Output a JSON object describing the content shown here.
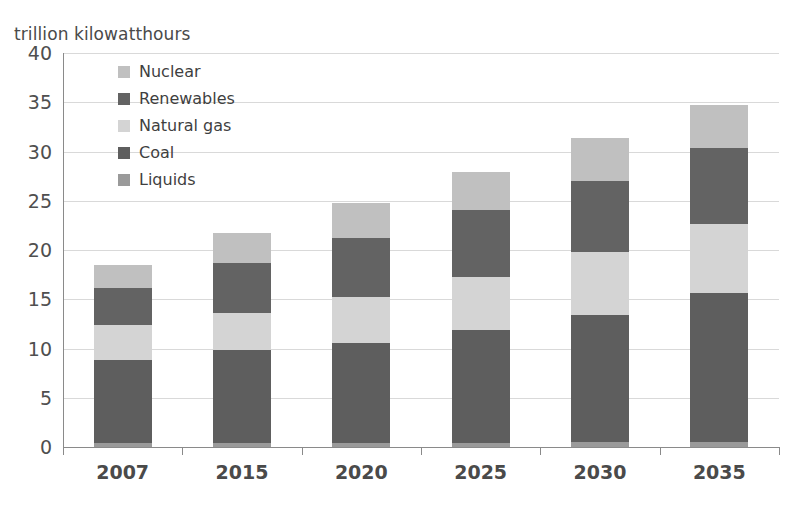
{
  "chart_data": {
    "type": "bar",
    "stacked": true,
    "title": "",
    "subtitle": "",
    "xlabel": "",
    "ylabel": "trillion kilowatthours",
    "ylim": [
      0,
      40
    ],
    "ytick_step": 5,
    "ytick_labels": [
      "40",
      "35",
      "30",
      "25",
      "20",
      "15",
      "10",
      "5",
      "0"
    ],
    "grid": true,
    "legend_position": "top-left",
    "categories": [
      "2007",
      "2015",
      "2020",
      "2025",
      "2030",
      "2035"
    ],
    "series": [
      {
        "name": "Liquids",
        "color": "#9a9a9a",
        "values": [
          0.4,
          0.4,
          0.4,
          0.4,
          0.5,
          0.5
        ]
      },
      {
        "name": "Coal",
        "color": "#5e5e5e",
        "values": [
          8.4,
          9.4,
          10.2,
          11.5,
          12.9,
          15.1
        ]
      },
      {
        "name": "Natural gas",
        "color": "#d4d4d4",
        "values": [
          3.6,
          3.8,
          4.6,
          5.4,
          6.4,
          7.0
        ]
      },
      {
        "name": "Renewables",
        "color": "#636363",
        "values": [
          3.7,
          5.1,
          6.0,
          6.8,
          7.2,
          7.8
        ]
      },
      {
        "name": "Nuclear",
        "color": "#c0c0c0",
        "values": [
          2.4,
          3.0,
          3.6,
          3.8,
          4.4,
          4.3
        ]
      }
    ],
    "totals": [
      18.5,
      21.7,
      24.8,
      27.9,
      31.4,
      34.7
    ],
    "legend_order": [
      "Nuclear",
      "Renewables",
      "Natural gas",
      "Coal",
      "Liquids"
    ]
  },
  "colors": {
    "nuclear": "#c0c0c0",
    "renewables": "#636363",
    "natural_gas": "#d4d4d4",
    "coal": "#5e5e5e",
    "liquids": "#9a9a9a",
    "gridline": "#d9d9d9",
    "axis": "#8a8a8a",
    "text": "#4a4a4a",
    "background": "#ffffff"
  }
}
